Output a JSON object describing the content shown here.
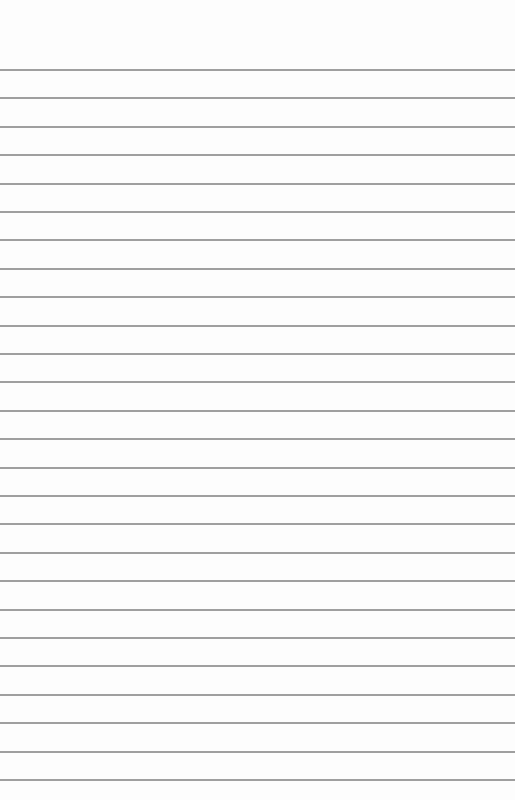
{
  "paper": {
    "type": "lined-paper",
    "background_color": "#fdfdfd",
    "line_color": "#8e8e8e",
    "first_line_y": 70,
    "line_spacing": 28.4,
    "line_count": 26
  }
}
